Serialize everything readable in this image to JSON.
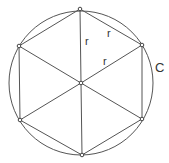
{
  "diagram": {
    "stroke_color": "#555555",
    "circle": {
      "label": "C",
      "cx": 81,
      "cy": 83,
      "r": 72
    },
    "center": {
      "x": 81,
      "y": 83
    },
    "vertices": [
      {
        "x": 80,
        "y": 9
      },
      {
        "x": 142,
        "y": 45
      },
      {
        "x": 142,
        "y": 119
      },
      {
        "x": 82,
        "y": 155
      },
      {
        "x": 20,
        "y": 120
      },
      {
        "x": 19,
        "y": 46
      }
    ],
    "labels": {
      "circle": "C",
      "radius_1": "r",
      "radius_2": "r",
      "radius_3": "r"
    }
  }
}
